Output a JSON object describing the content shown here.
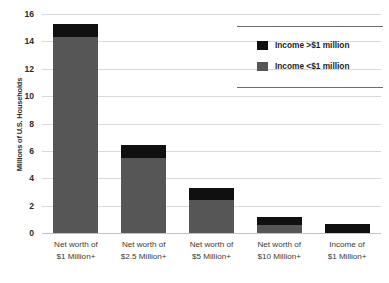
{
  "chart_data": {
    "type": "bar",
    "subtype": "stacked-vertical",
    "title": "",
    "subtitle": "",
    "xlabel": "",
    "ylabel": "Millions of U.S. Households",
    "ylim": [
      0,
      16
    ],
    "ytick_values": [
      0,
      2,
      4,
      6,
      8,
      10,
      12,
      14,
      16
    ],
    "ytick_labels": [
      "0",
      "2",
      "4",
      "6",
      "8",
      "10",
      "12",
      "14",
      "16"
    ],
    "grid": "horizontal",
    "legend_position": "top-right",
    "categories": [
      "Net worth of $1 Million+",
      "Net worth of $2.5 Million+",
      "Net worth of $5 Million+",
      "Net worth of $10 Million+",
      "Income of $1 Million+"
    ],
    "category_lines": [
      [
        "Net worth of",
        "$1 Million+"
      ],
      [
        "Net worth of",
        "$2.5 Million+"
      ],
      [
        "Net worth of",
        "$5 Million+"
      ],
      [
        "Net worth of",
        "$10 Million+"
      ],
      [
        "Income of",
        "$1 Million+"
      ]
    ],
    "series": [
      {
        "name": "Income <$1 million",
        "color": "#565656",
        "values": [
          14.3,
          5.5,
          2.4,
          0.6,
          0.0
        ]
      },
      {
        "name": "Income >$1 million",
        "color": "#101010",
        "values": [
          1.0,
          0.9,
          0.9,
          0.55,
          0.65
        ]
      }
    ],
    "totals": [
      15.3,
      6.4,
      3.3,
      1.15,
      0.65
    ]
  },
  "legend": {
    "entries": [
      {
        "label": "Income >$1 million",
        "color": "#101010"
      },
      {
        "label": "Income <$1 million",
        "color": "#565656"
      }
    ]
  },
  "axes": {
    "y_title": "Millions of U.S. Households"
  },
  "colors": {
    "series_high": "#101010",
    "series_low": "#565656",
    "gridline": "#d9d9d9",
    "axis_line": "#c2c2c2",
    "legend_rule": "#6e6e6e",
    "text": "#2b2b2b",
    "background": "#ffffff"
  }
}
